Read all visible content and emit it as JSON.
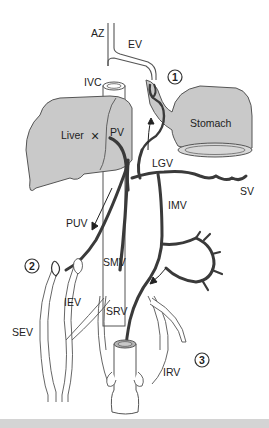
{
  "diagram": {
    "colors": {
      "organ_fill": "#c9c9c9",
      "outline": "#555555",
      "portal_vein": "#3a3a3a",
      "systemic_vein_fill": "#ffffff",
      "lumen_fill": "#b5b5b5",
      "background": "#ffffff",
      "bottom_strip": "#d4d4d4"
    },
    "labels": {
      "az": "AZ",
      "ev": "EV",
      "ivc": "IVC",
      "liver": "Liver",
      "pv": "PV",
      "stomach": "Stomach",
      "lgv": "LGV",
      "sv": "SV",
      "imv": "IMV",
      "puv": "PUV",
      "smv": "SMV",
      "iev": "IEV",
      "sev": "SEV",
      "srv": "SRV",
      "irv": "IRV",
      "obstruction_mark": "×"
    },
    "markers": [
      {
        "id": "1",
        "label": "1",
        "site": "gastroesophageal"
      },
      {
        "id": "2",
        "label": "2",
        "site": "paraumbilical / abdominal wall"
      },
      {
        "id": "3",
        "label": "3",
        "site": "rectal"
      }
    ],
    "legend": {
      "AZ": "Azygos vein",
      "EV": "Esophageal veins",
      "IVC": "Inferior vena cava",
      "PV": "Portal vein",
      "LGV": "Left gastric vein",
      "SV": "Splenic vein",
      "IMV": "Inferior mesenteric vein",
      "PUV": "Paraumbilical vein",
      "SMV": "Superior mesenteric vein",
      "IEV": "Inferior epigastric vein",
      "SEV": "Superficial epigastric vein",
      "SRV": "Superior rectal vein",
      "IRV": "Inferior rectal vein"
    }
  }
}
